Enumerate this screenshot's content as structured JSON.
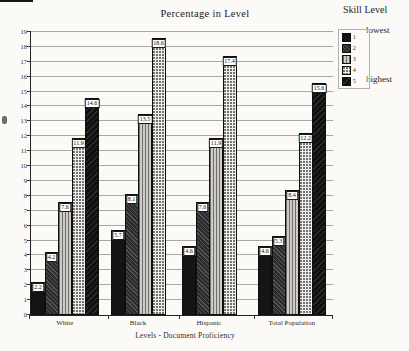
{
  "title": "Percentage in Level",
  "legend": {
    "title": "Skill Level",
    "top_label": "lowest",
    "bottom_label": "highest",
    "items": [
      {
        "label": "1"
      },
      {
        "label": "2"
      },
      {
        "label": "3"
      },
      {
        "label": "4"
      },
      {
        "label": "5"
      }
    ]
  },
  "chart_data": {
    "type": "bar",
    "title": "Percentage in Level",
    "xlabel": "Levels - Document Proficiency",
    "ylabel": "",
    "ylim": [
      0,
      19
    ],
    "ytick_step": 1,
    "yticks": [
      0,
      1,
      2,
      3,
      4,
      5,
      6,
      7,
      8,
      9,
      10,
      11,
      12,
      13,
      14,
      15,
      16,
      17,
      18,
      19
    ],
    "grid": true,
    "legend_position": "top-right",
    "series_levels": [
      "1",
      "2",
      "3",
      "4",
      "5"
    ],
    "categories": [
      "White",
      "Black",
      "Hispanic",
      "Total Population"
    ],
    "groups": [
      {
        "category": "White",
        "values": [
          2.2,
          4.2,
          7.6,
          11.9,
          14.6
        ]
      },
      {
        "category": "Black",
        "values": [
          5.7,
          8.1,
          13.5,
          18.6,
          null
        ]
      },
      {
        "category": "Hispanic",
        "values": [
          4.6,
          7.6,
          11.9,
          17.4,
          null
        ]
      },
      {
        "category": "Total Population",
        "values": [
          4.6,
          5.3,
          8.4,
          12.2,
          15.6
        ]
      }
    ],
    "colors": {
      "level1": "#141414",
      "level2": "#2b2b2b",
      "level3": "#cfccc6",
      "level4": "#f1efe9",
      "level5": "#101010",
      "gridline": "#a9a7a2"
    }
  }
}
